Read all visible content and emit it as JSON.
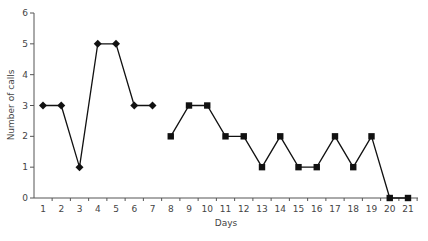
{
  "chart_data": {
    "type": "line",
    "title": "",
    "xlabel": "Days",
    "ylabel": "Number of calls",
    "ylim": [
      0,
      6
    ],
    "yticks": [
      0,
      1,
      2,
      3,
      4,
      5,
      6
    ],
    "xticks": [
      1,
      2,
      3,
      4,
      5,
      6,
      7,
      8,
      9,
      10,
      11,
      12,
      13,
      14,
      15,
      16,
      17,
      18,
      19,
      20,
      21
    ],
    "grid": false,
    "legend": null,
    "series": [
      {
        "name": "Days 1-7",
        "marker": "diamond",
        "x": [
          1,
          2,
          3,
          4,
          5,
          6,
          7
        ],
        "values": [
          3,
          3,
          1,
          5,
          5,
          3,
          3
        ]
      },
      {
        "name": "Days 8-21",
        "marker": "square",
        "x": [
          8,
          9,
          10,
          11,
          12,
          13,
          14,
          15,
          16,
          17,
          18,
          19,
          20,
          21
        ],
        "values": [
          2,
          3,
          3,
          2,
          2,
          1,
          2,
          1,
          1,
          2,
          1,
          2,
          0,
          0
        ]
      }
    ],
    "colors": {
      "line": "#111111",
      "axis": "#555555",
      "text": "#444444"
    }
  }
}
